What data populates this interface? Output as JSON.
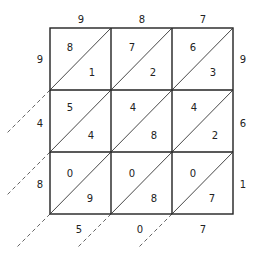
{
  "diagram": {
    "type": "lattice-multiplication",
    "top_digits": [
      "9",
      "8",
      "7"
    ],
    "left_digits": [
      "9",
      "4",
      "8"
    ],
    "right_digits": [
      "9",
      "6",
      "1"
    ],
    "bottom_digits": [
      "5",
      "0",
      "7"
    ],
    "cells": [
      [
        {
          "tens": "8",
          "ones": "1"
        },
        {
          "tens": "7",
          "ones": "2"
        },
        {
          "tens": "6",
          "ones": "3"
        }
      ],
      [
        {
          "tens": "5",
          "ones": "4"
        },
        {
          "tens": "4",
          "ones": "8"
        },
        {
          "tens": "4",
          "ones": "2"
        }
      ],
      [
        {
          "tens": "0",
          "ones": "9"
        },
        {
          "tens": "0",
          "ones": "8"
        },
        {
          "tens": "0",
          "ones": "7"
        }
      ]
    ]
  }
}
